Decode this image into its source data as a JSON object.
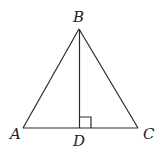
{
  "diagram": {
    "type": "triangle-with-altitude",
    "points": {
      "A": {
        "label": "A",
        "x": 23,
        "y": 128
      },
      "B": {
        "label": "B",
        "x": 79,
        "y": 29
      },
      "C": {
        "label": "C",
        "x": 138,
        "y": 128
      },
      "D": {
        "label": "D",
        "x": 80,
        "y": 128
      }
    },
    "segments": [
      "AB",
      "BC",
      "AC",
      "BD"
    ],
    "right_angle_at": "D",
    "colors": {
      "stroke": "#2a2a2a",
      "background": "#ffffff"
    }
  }
}
